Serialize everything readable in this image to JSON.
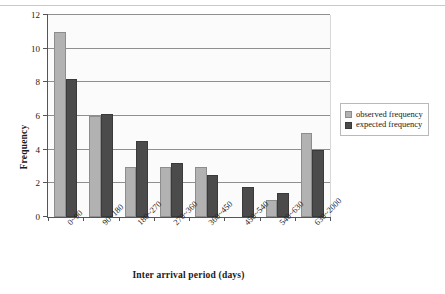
{
  "chart_data": {
    "type": "bar",
    "title": "",
    "xlabel": "Inter arrival period (days)",
    "ylabel": "Frequency",
    "categories": [
      "0~90",
      "90~180",
      "180~270",
      "270~360",
      "360~450",
      "450~540",
      "540~630",
      "630~2000"
    ],
    "series": [
      {
        "name": "observed frequency",
        "color": "#b2b2b2",
        "values": [
          11,
          6,
          3,
          3,
          3,
          0,
          1,
          5
        ]
      },
      {
        "name": "expected frequency",
        "color": "#4b4b4b",
        "values": [
          8.2,
          6.1,
          4.5,
          3.2,
          2.5,
          1.8,
          1.4,
          4
        ]
      }
    ],
    "ylim": [
      0,
      12
    ],
    "yticks": [
      0,
      2,
      4,
      6,
      8,
      10,
      12
    ],
    "ytick_labels": [
      "0",
      "2",
      "4",
      "6",
      "8",
      "10",
      "12"
    ],
    "grid": "horizontal",
    "legend_position": "right"
  },
  "legend": {
    "items": [
      {
        "label": "observed frequency"
      },
      {
        "label": "expected frequency"
      }
    ]
  },
  "axes": {
    "y_title": "Frequency",
    "x_title": "Inter arrival period (days)"
  }
}
